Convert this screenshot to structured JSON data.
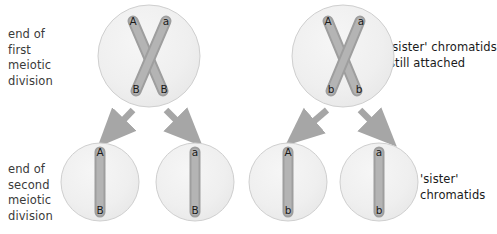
{
  "figure": {
    "background_color": "#ffffff",
    "cell_fill": "#f0f0f0",
    "cell_stroke": "#c9c9c9",
    "chromatid_fill": "#a8a8a8",
    "chromatid_stroke": "#8d8d8d",
    "arrow_color": "#a6a6a6",
    "text_color": "#3a3a3a"
  },
  "labels": {
    "first_division": "end of\nfirst\nmeiotic\ndivision",
    "second_division": "end of\nsecond\nmeiotic\ndivision",
    "sister_attached": "'sister' chromatids\nstill attached",
    "sister_chromatids": "'sister'\nchromatids"
  },
  "row_top": {
    "cells": [
      {
        "name": "cell-top-left",
        "chromatids": [
          {
            "name": "chromatid-left",
            "top_allele": "A",
            "bottom_allele": "B"
          },
          {
            "name": "chromatid-right",
            "top_allele": "a",
            "bottom_allele": "B"
          }
        ]
      },
      {
        "name": "cell-top-right",
        "chromatids": [
          {
            "name": "chromatid-left",
            "top_allele": "A",
            "bottom_allele": "b"
          },
          {
            "name": "chromatid-right",
            "top_allele": "a",
            "bottom_allele": "b"
          }
        ]
      }
    ]
  },
  "row_bottom": {
    "cells": [
      {
        "name": "cell-bottom-1",
        "top_allele": "A",
        "bottom_allele": "B"
      },
      {
        "name": "cell-bottom-2",
        "top_allele": "a",
        "bottom_allele": "B"
      },
      {
        "name": "cell-bottom-3",
        "top_allele": "A",
        "bottom_allele": "b"
      },
      {
        "name": "cell-bottom-4",
        "top_allele": "a",
        "bottom_allele": "b"
      }
    ]
  },
  "arrows": [
    {
      "name": "arrow-top-left-to-bottom-1"
    },
    {
      "name": "arrow-top-left-to-bottom-2"
    },
    {
      "name": "arrow-top-right-to-bottom-3"
    },
    {
      "name": "arrow-top-right-to-bottom-4"
    }
  ]
}
